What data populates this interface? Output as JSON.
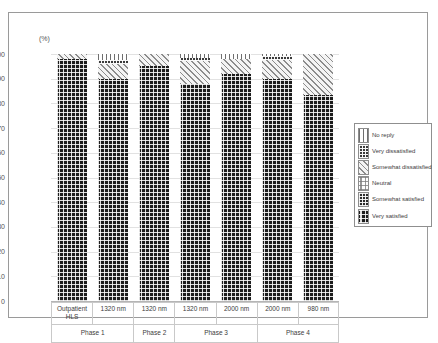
{
  "chart_data": {
    "type": "bar",
    "stacked": true,
    "title": "",
    "xlabel": "",
    "ylabel": "(%)",
    "unit_label": "(%)",
    "ylim": [
      0,
      100
    ],
    "ytick_labels": [
      "100",
      "90",
      "80",
      "70",
      "60",
      "50",
      "40",
      "30",
      "20",
      "10",
      "0"
    ],
    "ytick_values": [
      100,
      90,
      80,
      70,
      60,
      50,
      40,
      30,
      20,
      10,
      0
    ],
    "grid": true,
    "legend_position": "right",
    "categories": [
      "Outpatient\nHLS",
      "1320 nm",
      "1320 nm",
      "1320 nm",
      "2000 nm",
      "2000 nm",
      "980 nm"
    ],
    "category_labels": [
      "Outpatient HLS",
      "1320 nm",
      "1320 nm",
      "1320 nm",
      "2000 nm",
      "2000 nm",
      "980 nm"
    ],
    "groups": [
      {
        "label": "Phase 1",
        "span": 2
      },
      {
        "label": "Phase 2",
        "span": 1
      },
      {
        "label": "Phase 3",
        "span": 2
      },
      {
        "label": "Phase 4",
        "span": 2
      }
    ],
    "series": [
      {
        "name": "Very satisfied",
        "pattern": "dark-dotted",
        "values": [
          98.0,
          90.0,
          95.0,
          88.0,
          92.0,
          90.0,
          83.5
        ]
      },
      {
        "name": "Somewhat satisfied",
        "pattern": "dark-checker",
        "values": [
          0.0,
          0.0,
          0.0,
          0.0,
          0.0,
          0.0,
          0.0
        ]
      },
      {
        "name": "Neutral",
        "pattern": "light-dotted",
        "values": [
          0.0,
          0.0,
          0.0,
          0.0,
          0.0,
          0.0,
          0.0
        ]
      },
      {
        "name": "Somewhat dissatisfied",
        "pattern": "diagonal-hatch",
        "values": [
          2.0,
          6.0,
          5.0,
          9.0,
          6.0,
          7.5,
          16.5
        ]
      },
      {
        "name": "Very dissatisfied",
        "pattern": "dark-fine-grid",
        "values": [
          0.0,
          1.5,
          0.0,
          1.5,
          0.0,
          1.5,
          0.0
        ]
      },
      {
        "name": "No reply",
        "pattern": "vertical-lines",
        "values": [
          0.0,
          2.5,
          0.0,
          1.5,
          2.0,
          1.0,
          0.0
        ]
      }
    ]
  },
  "legend": {
    "items": [
      {
        "label": "No reply"
      },
      {
        "label": "Very dissatisfied"
      },
      {
        "label": "Somewhat dissatisfied"
      },
      {
        "label": "Neutral"
      },
      {
        "label": "Somewhat satisfied"
      },
      {
        "label": "Very satisfied"
      }
    ]
  }
}
